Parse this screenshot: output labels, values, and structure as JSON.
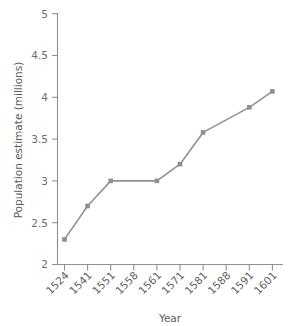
{
  "chart_data": {
    "type": "line",
    "title": "",
    "subtitle": "",
    "xlabel": "Year",
    "ylabel": "Population estimate (millions)",
    "categories": [
      "1524",
      "1541",
      "1551",
      "1558",
      "1561",
      "1571",
      "1581",
      "1588",
      "1591",
      "1601"
    ],
    "values": [
      2.3,
      2.7,
      3.0,
      null,
      3.0,
      3.2,
      3.58,
      null,
      3.88,
      4.07
    ],
    "markers_at": [
      "1524",
      "1541",
      "1551",
      "1561",
      "1571",
      "1581",
      "1591",
      "1601"
    ],
    "ylim": [
      2,
      5
    ],
    "yticks": [
      2,
      2.5,
      3,
      3.5,
      4,
      4.5,
      5
    ],
    "ytick_labels": [
      "2",
      "2.5",
      "3",
      "3.5",
      "4",
      "4.5",
      "5"
    ],
    "grid": false,
    "legend": null,
    "series_color": "#919191",
    "marker_color": "#8f8f8f",
    "marker_shape": "square",
    "xtick_rotation": 45,
    "annotations": []
  },
  "axis_labels": {
    "x": "Year",
    "y": "Population estimate (millions)"
  },
  "colors": {
    "line": "#919191",
    "marker": "#8f8f8f",
    "axis": "#8f8f8f",
    "tick_text": "#5e5e5e",
    "label_text": "#5b5b5b",
    "background": "#ffffff"
  }
}
